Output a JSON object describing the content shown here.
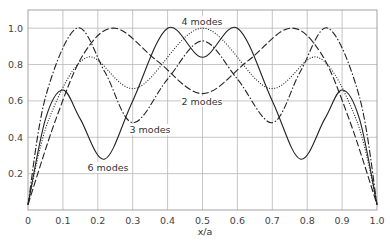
{
  "chart_data": {
    "type": "line",
    "title": "",
    "xlabel": "x/a",
    "ylabel": "",
    "xlim": [
      0,
      1.0
    ],
    "ylim": [
      0,
      1.1
    ],
    "grid": true,
    "xticks": [
      "0",
      "0.1",
      "0.2",
      "0.3",
      "0.4",
      "0.5",
      "0.6",
      "0.7",
      "0.8",
      "0.9",
      "1.0"
    ],
    "yticks": [
      "0.2",
      "0.4",
      "0.6",
      "0.8",
      "1.0"
    ],
    "series": [
      {
        "name": "6 modes",
        "style": "solid",
        "x": [
          0,
          0.05,
          0.1,
          0.15,
          0.22,
          0.3,
          0.4,
          0.5,
          0.6,
          0.7,
          0.78,
          0.85,
          0.9,
          0.95,
          1.0
        ],
        "y": [
          0.03,
          0.5,
          0.66,
          0.5,
          0.28,
          0.6,
          1.0,
          0.84,
          1.0,
          0.6,
          0.28,
          0.5,
          0.66,
          0.5,
          0.03
        ]
      },
      {
        "name": "3 modes",
        "style": "dashdot",
        "x": [
          0,
          0.05,
          0.14,
          0.22,
          0.3,
          0.4,
          0.5,
          0.6,
          0.7,
          0.78,
          0.86,
          0.95,
          1.0
        ],
        "y": [
          0.03,
          0.62,
          1.0,
          0.76,
          0.48,
          0.72,
          0.93,
          0.72,
          0.48,
          0.76,
          1.0,
          0.62,
          0.03
        ]
      },
      {
        "name": "2 modes",
        "style": "dashed",
        "x": [
          0,
          0.08,
          0.16,
          0.25,
          0.37,
          0.5,
          0.63,
          0.75,
          0.84,
          0.92,
          1.0
        ],
        "y": [
          0.03,
          0.5,
          0.86,
          1.0,
          0.82,
          0.64,
          0.82,
          1.0,
          0.86,
          0.5,
          0.03
        ]
      },
      {
        "name": "4 modes",
        "style": "dotted",
        "x": [
          0,
          0.06,
          0.17,
          0.31,
          0.5,
          0.69,
          0.83,
          0.94,
          1.0
        ],
        "y": [
          0.03,
          0.5,
          0.84,
          0.67,
          1.0,
          0.67,
          0.84,
          0.5,
          0.03
        ]
      }
    ],
    "annotations": [
      {
        "text": "4 modes",
        "x": 0.5,
        "y": 1.05
      },
      {
        "text": "2 modes",
        "x": 0.5,
        "y": 0.59
      },
      {
        "text": "3 modes",
        "x": 0.35,
        "y": 0.44
      },
      {
        "text": "6 modes",
        "x": 0.23,
        "y": 0.23
      }
    ]
  },
  "layout": {
    "plot": {
      "left": 28,
      "top": 10,
      "right": 377,
      "bottom": 210
    },
    "label_offsets": {
      "4 modes": [
        202,
        25
      ],
      "2 modes": [
        202,
        105
      ],
      "3 modes": [
        150,
        133
      ],
      "6 modes": [
        108,
        171
      ]
    }
  }
}
